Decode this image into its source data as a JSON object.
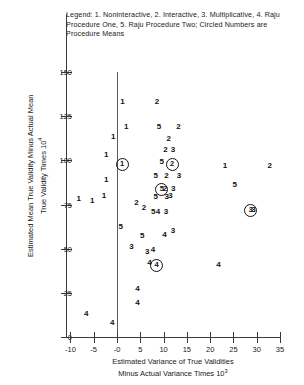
{
  "legend": {
    "text": "Legend: 1. Noninteractive, 2. Interactive, 3. Multiplicative, 4. Raju Procedure One, 5. Raju Procedure Two; Circled Numbers are Procedure Means"
  },
  "chart_data": {
    "type": "scatter",
    "title": "",
    "xlabel": "Estimated Variance of True Validities Minus Actual Variance Times 10³",
    "ylabel": "Estimated Mean True Validity Minus Actual Mean True Validity Times 10⁴",
    "xlim": [
      -13,
      37
    ],
    "ylim": [
      0,
      158
    ],
    "xticks": [
      "-10",
      "-5",
      "-0",
      "5",
      "10",
      "15",
      "20",
      "25",
      "30",
      "35"
    ],
    "xtick_values": [
      -10,
      -5,
      0,
      5,
      10,
      15,
      20,
      25,
      30,
      35
    ],
    "yticks": [
      "0",
      "25",
      "50",
      "75",
      "100",
      "125",
      "150"
    ],
    "ytick_values": [
      0,
      25,
      50,
      75,
      100,
      125,
      150
    ],
    "grid": false,
    "legend_position": "top",
    "reference_line_x": 0,
    "series": [
      {
        "name": "1. Noninteractive",
        "marker": "1"
      },
      {
        "name": "2. Interactive",
        "marker": "2"
      },
      {
        "name": "3. Multiplicative",
        "marker": "3"
      },
      {
        "name": "4. Raju Procedure One",
        "marker": "4"
      },
      {
        "name": "5. Raju Procedure Two",
        "marker": "5"
      }
    ],
    "points": [
      {
        "label": "1",
        "x": 1.2,
        "y": 133,
        "circled": false
      },
      {
        "label": "2",
        "x": 8.6,
        "y": 133,
        "circled": false
      },
      {
        "label": "1",
        "x": 2.0,
        "y": 119,
        "circled": false
      },
      {
        "label": "5",
        "x": 9.0,
        "y": 119,
        "circled": false
      },
      {
        "label": "2",
        "x": 13.2,
        "y": 119,
        "circled": false
      },
      {
        "label": "1",
        "x": -0.8,
        "y": 113,
        "circled": false
      },
      {
        "label": "2",
        "x": 11.1,
        "y": 112,
        "circled": false
      },
      {
        "label": "2",
        "x": 10.4,
        "y": 106,
        "circled": false
      },
      {
        "label": "3",
        "x": 12.0,
        "y": 106,
        "circled": false
      },
      {
        "label": "1",
        "x": -2.3,
        "y": 103,
        "circled": false
      },
      {
        "label": "5",
        "x": 9.6,
        "y": 99,
        "circled": false
      },
      {
        "label": "1",
        "x": 0.9,
        "y": 98,
        "circled": true
      },
      {
        "label": "2",
        "x": 11.6,
        "y": 98,
        "circled": true
      },
      {
        "label": "1",
        "x": 23.2,
        "y": 97,
        "circled": false
      },
      {
        "label": "2",
        "x": 32.8,
        "y": 97,
        "circled": false
      },
      {
        "label": "5",
        "x": 8.3,
        "y": 91,
        "circled": false
      },
      {
        "label": "2",
        "x": 10.6,
        "y": 91,
        "circled": false
      },
      {
        "label": "3",
        "x": 13.3,
        "y": 91,
        "circled": false
      },
      {
        "label": "1",
        "x": -2.3,
        "y": 89,
        "circled": false
      },
      {
        "label": "5",
        "x": 25.3,
        "y": 86,
        "circled": false
      },
      {
        "label": "5",
        "x": 9.4,
        "y": 84,
        "circled": true
      },
      {
        "label": "2",
        "x": 10.3,
        "y": 84,
        "circled": false
      },
      {
        "label": "3",
        "x": 12.1,
        "y": 84,
        "circled": false
      },
      {
        "label": "1",
        "x": -2.8,
        "y": 80,
        "circled": false
      },
      {
        "label": "3",
        "x": 10.7,
        "y": 79,
        "circled": false
      },
      {
        "label": "1",
        "x": -8.2,
        "y": 78,
        "circled": false
      },
      {
        "label": "1",
        "x": -5.3,
        "y": 77,
        "circled": false
      },
      {
        "label": "2",
        "x": 4.2,
        "y": 76,
        "circled": false
      },
      {
        "label": "5",
        "x": 8.3,
        "y": 79,
        "circled": false
      },
      {
        "label": "3",
        "x": 11.5,
        "y": 80,
        "circled": false
      },
      {
        "label": "2",
        "x": 5.8,
        "y": 73,
        "circled": false
      },
      {
        "label": "5",
        "x": 7.8,
        "y": 71,
        "circled": false
      },
      {
        "label": "4",
        "x": 8.8,
        "y": 71,
        "circled": false
      },
      {
        "label": "3",
        "x": 10.5,
        "y": 71,
        "circled": false
      },
      {
        "label": "3",
        "x": 28.5,
        "y": 72,
        "circled": true
      },
      {
        "label": "3",
        "x": 29.3,
        "y": 72,
        "circled": false
      },
      {
        "label": "5",
        "x": 0.8,
        "y": 62,
        "circled": false
      },
      {
        "label": "5",
        "x": 5.4,
        "y": 57,
        "circled": false
      },
      {
        "label": "4",
        "x": 10.2,
        "y": 58,
        "circled": false
      },
      {
        "label": "3",
        "x": 12.0,
        "y": 60,
        "circled": false
      },
      {
        "label": "3",
        "x": 3.1,
        "y": 51,
        "circled": false
      },
      {
        "label": "3",
        "x": 6.5,
        "y": 48,
        "circled": false
      },
      {
        "label": "4",
        "x": 7.7,
        "y": 49,
        "circled": false
      },
      {
        "label": "4",
        "x": 7.0,
        "y": 42,
        "circled": false
      },
      {
        "label": "4",
        "x": 8.3,
        "y": 41,
        "circled": true
      },
      {
        "label": "4",
        "x": 21.8,
        "y": 41,
        "circled": false
      },
      {
        "label": "4",
        "x": 4.4,
        "y": 27,
        "circled": false
      },
      {
        "label": "4",
        "x": 4.4,
        "y": 19,
        "circled": false
      },
      {
        "label": "4",
        "x": -6.6,
        "y": 13,
        "circled": false
      },
      {
        "label": "4",
        "x": -1.0,
        "y": 8,
        "circled": false
      }
    ]
  }
}
